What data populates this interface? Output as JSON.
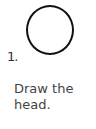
{
  "step": {
    "number": "1.",
    "line1": "Draw the",
    "line2": "head.",
    "shape": "circle"
  }
}
